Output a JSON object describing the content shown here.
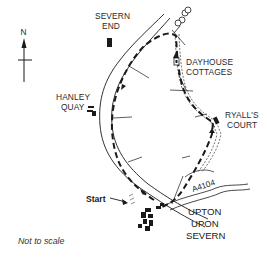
{
  "map": {
    "compass": {
      "label": "N"
    },
    "places": {
      "severn_end": [
        "SEVERN",
        "END"
      ],
      "hanley_quay": [
        "HANLEY",
        "QUAY"
      ],
      "dayhouse_cottages": [
        "DAYHOUSE",
        "COTTAGES"
      ],
      "ryalls_court": [
        "RYALL'S",
        "COURT"
      ],
      "upton_upon_severn": [
        "UPTON",
        "UPON",
        "SEVERN"
      ]
    },
    "road": {
      "label": "A4104"
    },
    "start": {
      "label": "Start"
    },
    "scale_note": "Not to scale",
    "colors": {
      "ink": "#1a1a1a",
      "background": "#ffffff"
    }
  }
}
